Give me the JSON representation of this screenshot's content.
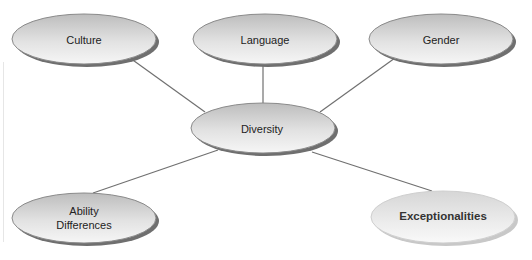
{
  "diagram": {
    "type": "hub-and-spoke concept map",
    "colors": {
      "node_fill_light": "#f4f4f4",
      "node_fill_dark": "#b9b9b9",
      "node_stroke": "#8a8a8a",
      "node_shadow": "#6f6f6f",
      "highlight_fill_light": "#f7f7f7",
      "highlight_fill_dark": "#d9d9d9",
      "highlight_shadow": "#c4c4c4",
      "connector": "#707070"
    },
    "hub": {
      "label": "Diversity",
      "cx": 263,
      "cy": 128,
      "rx": 72,
      "ry": 25
    },
    "nodes": [
      {
        "id": "culture",
        "label": "Culture",
        "cx": 84,
        "cy": 39,
        "rx": 72,
        "ry": 25
      },
      {
        "id": "language",
        "label": "Language",
        "cx": 265,
        "cy": 39,
        "rx": 72,
        "ry": 25
      },
      {
        "id": "gender",
        "label": "Gender",
        "cx": 441,
        "cy": 39,
        "rx": 72,
        "ry": 25
      },
      {
        "id": "ability",
        "label_line1": "Ability",
        "label_line2": "Differences",
        "cx": 84,
        "cy": 218,
        "rx": 72,
        "ry": 25
      },
      {
        "id": "exceptionalities",
        "label": "Exceptionalities",
        "cx": 443,
        "cy": 217,
        "rx": 72,
        "ry": 26,
        "highlighted": true
      }
    ]
  }
}
